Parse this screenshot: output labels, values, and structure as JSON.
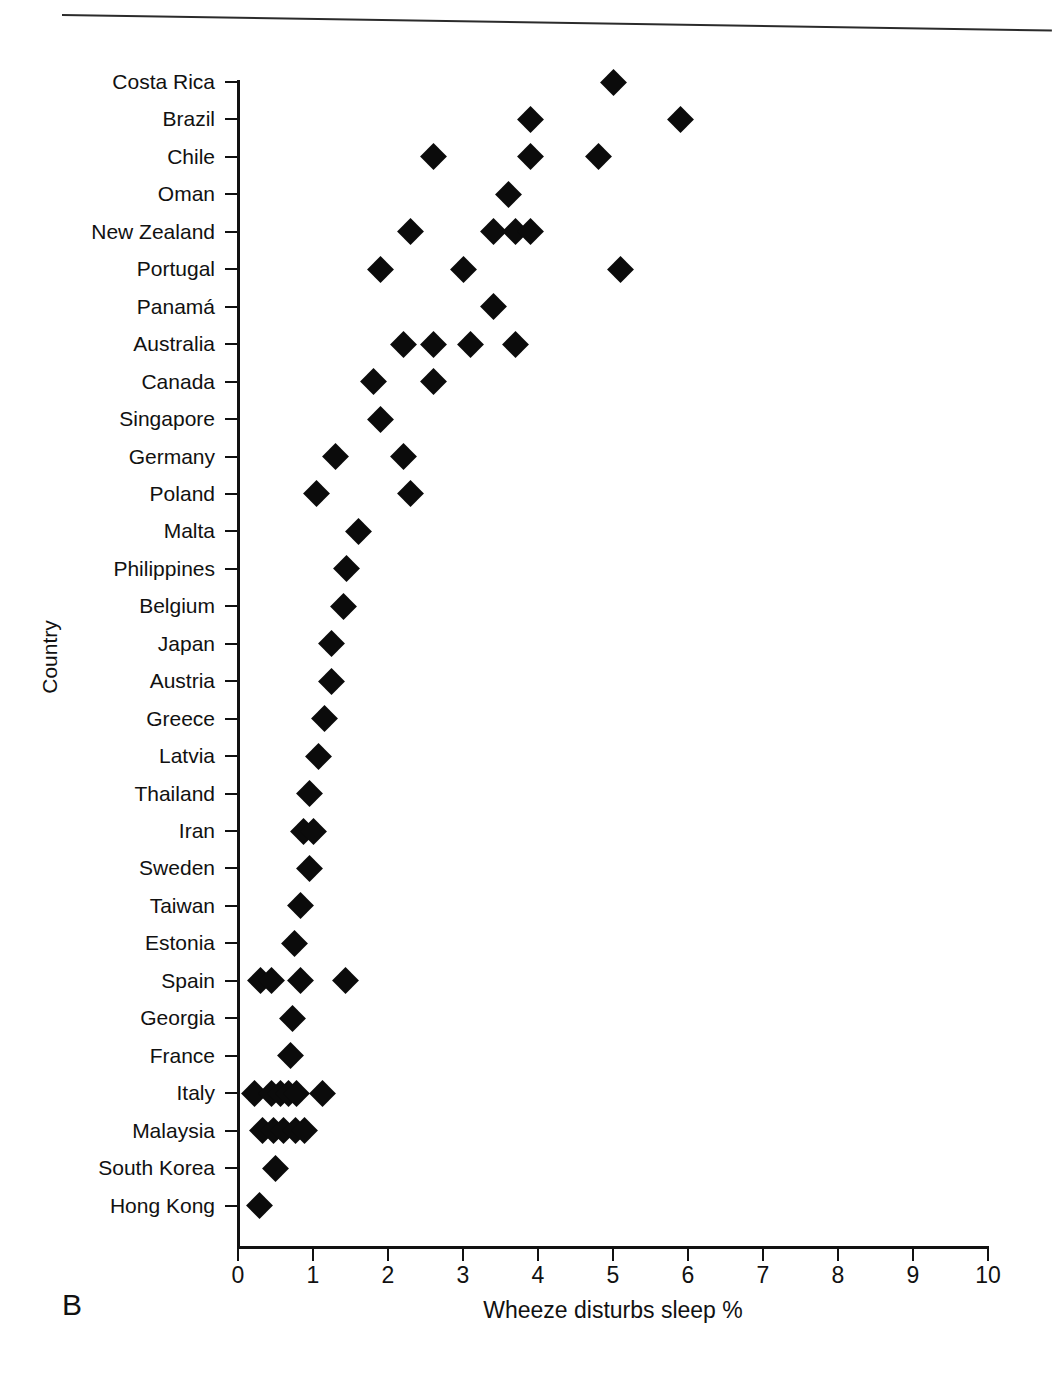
{
  "figure": {
    "panel_letter": "B",
    "y_axis_title": "Country",
    "x_axis_title": "Wheeze disturbs sleep %"
  },
  "chart_data": {
    "type": "scatter",
    "title": "",
    "subtitle": "",
    "xlabel": "Wheeze disturbs sleep %",
    "ylabel": "Country",
    "xlim": [
      0,
      10
    ],
    "xticks": [
      "0",
      "1",
      "2",
      "3",
      "4",
      "5",
      "6",
      "7",
      "8",
      "9",
      "10"
    ],
    "grid": false,
    "legend": null,
    "marker": "filled-diamond",
    "marker_color": "#0b0b0b",
    "orientation": "horizontal",
    "categories": [
      "Costa Rica",
      "Brazil",
      "Chile",
      "Oman",
      "New Zealand",
      "Portugal",
      "Panamá",
      "Australia",
      "Canada",
      "Singapore",
      "Germany",
      "Poland",
      "Malta",
      "Philippines",
      "Belgium",
      "Japan",
      "Austria",
      "Greece",
      "Latvia",
      "Thailand",
      "Iran",
      "Sweden",
      "Taiwan",
      "Estonia",
      "Spain",
      "Georgia",
      "France",
      "Italy",
      "Malaysia",
      "South Korea",
      "Hong Kong"
    ],
    "points": [
      {
        "category": "Costa Rica",
        "values": [
          5.0
        ]
      },
      {
        "category": "Brazil",
        "values": [
          3.9,
          5.9
        ]
      },
      {
        "category": "Chile",
        "values": [
          2.6,
          3.9,
          4.8
        ]
      },
      {
        "category": "Oman",
        "values": [
          3.6
        ]
      },
      {
        "category": "New Zealand",
        "values": [
          2.3,
          3.4,
          3.7,
          3.9
        ]
      },
      {
        "category": "Portugal",
        "values": [
          1.9,
          3.0,
          5.1
        ]
      },
      {
        "category": "Panamá",
        "values": [
          3.4
        ]
      },
      {
        "category": "Australia",
        "values": [
          2.2,
          2.6,
          3.1,
          3.7
        ]
      },
      {
        "category": "Canada",
        "values": [
          1.8,
          2.6
        ]
      },
      {
        "category": "Singapore",
        "values": [
          1.9
        ]
      },
      {
        "category": "Germany",
        "values": [
          1.3,
          2.2
        ]
      },
      {
        "category": "Poland",
        "values": [
          1.05,
          2.3
        ]
      },
      {
        "category": "Malta",
        "values": [
          1.6
        ]
      },
      {
        "category": "Philippines",
        "values": [
          1.45
        ]
      },
      {
        "category": "Belgium",
        "values": [
          1.4
        ]
      },
      {
        "category": "Japan",
        "values": [
          1.25
        ]
      },
      {
        "category": "Austria",
        "values": [
          1.25
        ]
      },
      {
        "category": "Greece",
        "values": [
          1.15
        ]
      },
      {
        "category": "Latvia",
        "values": [
          1.07
        ]
      },
      {
        "category": "Thailand",
        "values": [
          0.95
        ]
      },
      {
        "category": "Iran",
        "values": [
          0.87,
          1.0
        ]
      },
      {
        "category": "Sweden",
        "values": [
          0.95
        ]
      },
      {
        "category": "Taiwan",
        "values": [
          0.83
        ]
      },
      {
        "category": "Estonia",
        "values": [
          0.75
        ]
      },
      {
        "category": "Spain",
        "values": [
          0.3,
          0.45,
          0.83,
          1.43
        ]
      },
      {
        "category": "Georgia",
        "values": [
          0.72
        ]
      },
      {
        "category": "France",
        "values": [
          0.7
        ]
      },
      {
        "category": "Italy",
        "values": [
          0.22,
          0.45,
          0.57,
          0.67,
          0.78,
          1.12
        ]
      },
      {
        "category": "Malaysia",
        "values": [
          0.33,
          0.47,
          0.6,
          0.76,
          0.89
        ]
      },
      {
        "category": "South Korea",
        "values": [
          0.5
        ]
      },
      {
        "category": "Hong Kong",
        "values": [
          0.28
        ]
      }
    ]
  }
}
